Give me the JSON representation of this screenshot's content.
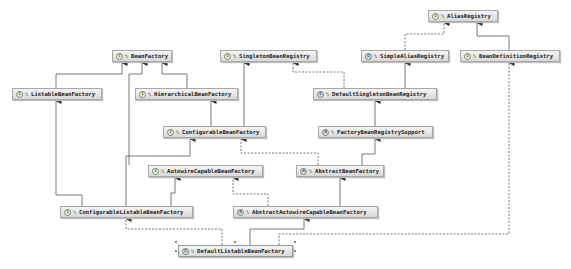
{
  "diagram": {
    "nodes": [
      {
        "id": "AliasRegistry",
        "label": "AliasRegistry",
        "kind": "interface",
        "icon": "I"
      },
      {
        "id": "BeanFactory",
        "label": "BeanFactory",
        "kind": "interface",
        "icon": "I"
      },
      {
        "id": "SingletonBeanRegistry",
        "label": "SingletonBeanRegistry",
        "kind": "interface",
        "icon": "I"
      },
      {
        "id": "SimpleAliasRegistry",
        "label": "SimpleAliasRegistry",
        "kind": "class",
        "icon": "C"
      },
      {
        "id": "BeanDefinitionRegistry",
        "label": "BeanDefinitionRegistry",
        "kind": "interface",
        "icon": "I"
      },
      {
        "id": "ListableBeanFactory",
        "label": "ListableBeanFactory",
        "kind": "interface",
        "icon": "I"
      },
      {
        "id": "HierarchicalBeanFactory",
        "label": "HierarchicalBeanFactory",
        "kind": "interface",
        "icon": "I"
      },
      {
        "id": "DefaultSingletonBeanRegistry",
        "label": "DefaultSingletonBeanRegistry",
        "kind": "class",
        "icon": "C"
      },
      {
        "id": "ConfigurableBeanFactory",
        "label": "ConfigurableBeanFactory",
        "kind": "interface",
        "icon": "I"
      },
      {
        "id": "FactoryBeanRegistrySupport",
        "label": "FactoryBeanRegistrySupport",
        "kind": "abstract",
        "icon": "A"
      },
      {
        "id": "AutowireCapableBeanFactory",
        "label": "AutowireCapableBeanFactory",
        "kind": "interface",
        "icon": "I"
      },
      {
        "id": "AbstractBeanFactory",
        "label": "AbstractBeanFactory",
        "kind": "abstract",
        "icon": "A"
      },
      {
        "id": "ConfigurableListableBeanFactory",
        "label": "ConfigurableListableBeanFactory",
        "kind": "interface",
        "icon": "I"
      },
      {
        "id": "AbstractAutowireCapableBeanFactory",
        "label": "AbstractAutowireCapableBeanFactory",
        "kind": "abstract",
        "icon": "A"
      },
      {
        "id": "DefaultListableBeanFactory",
        "label": "DefaultListableBeanFactory",
        "kind": "class",
        "icon": "C",
        "selected": true
      }
    ],
    "visibility_glyph": "%",
    "edges": [
      {
        "from": "SimpleAliasRegistry",
        "to": "AliasRegistry",
        "type": "implements"
      },
      {
        "from": "BeanDefinitionRegistry",
        "to": "AliasRegistry",
        "type": "extends"
      },
      {
        "from": "ListableBeanFactory",
        "to": "BeanFactory",
        "type": "extends"
      },
      {
        "from": "HierarchicalBeanFactory",
        "to": "BeanFactory",
        "type": "extends"
      },
      {
        "from": "AutowireCapableBeanFactory",
        "to": "BeanFactory",
        "type": "extends"
      },
      {
        "from": "DefaultSingletonBeanRegistry",
        "to": "SingletonBeanRegistry",
        "type": "implements"
      },
      {
        "from": "DefaultSingletonBeanRegistry",
        "to": "SimpleAliasRegistry",
        "type": "extends"
      },
      {
        "from": "ConfigurableBeanFactory",
        "to": "HierarchicalBeanFactory",
        "type": "extends"
      },
      {
        "from": "ConfigurableBeanFactory",
        "to": "SingletonBeanRegistry",
        "type": "extends"
      },
      {
        "from": "FactoryBeanRegistrySupport",
        "to": "DefaultSingletonBeanRegistry",
        "type": "extends"
      },
      {
        "from": "AbstractBeanFactory",
        "to": "FactoryBeanRegistrySupport",
        "type": "extends"
      },
      {
        "from": "AbstractBeanFactory",
        "to": "ConfigurableBeanFactory",
        "type": "implements"
      },
      {
        "from": "ConfigurableListableBeanFactory",
        "to": "ListableBeanFactory",
        "type": "extends"
      },
      {
        "from": "ConfigurableListableBeanFactory",
        "to": "ConfigurableBeanFactory",
        "type": "extends"
      },
      {
        "from": "ConfigurableListableBeanFactory",
        "to": "AutowireCapableBeanFactory",
        "type": "extends"
      },
      {
        "from": "AbstractAutowireCapableBeanFactory",
        "to": "AbstractBeanFactory",
        "type": "extends"
      },
      {
        "from": "AbstractAutowireCapableBeanFactory",
        "to": "AutowireCapableBeanFactory",
        "type": "implements"
      },
      {
        "from": "DefaultListableBeanFactory",
        "to": "AbstractAutowireCapableBeanFactory",
        "type": "extends"
      },
      {
        "from": "DefaultListableBeanFactory",
        "to": "ConfigurableListableBeanFactory",
        "type": "implements"
      },
      {
        "from": "DefaultListableBeanFactory",
        "to": "BeanDefinitionRegistry",
        "type": "implements"
      }
    ]
  }
}
